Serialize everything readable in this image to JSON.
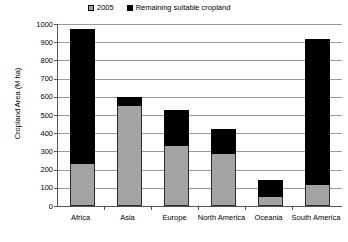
{
  "chart_data": {
    "type": "bar",
    "stacked": true,
    "title": "",
    "xlabel": "",
    "ylabel": "Cropland Area (M ha)",
    "ylim": [
      0,
      1000
    ],
    "ytick_step": 100,
    "yticks": [
      0,
      100,
      200,
      300,
      400,
      500,
      600,
      700,
      800,
      900,
      1000
    ],
    "grid": true,
    "legend_position": "top-center",
    "categories": [
      "Africa",
      "Asia",
      "Europe",
      "North America",
      "Oceania",
      "South America"
    ],
    "series": [
      {
        "name": "2005",
        "color": "#a3a3a3",
        "values": [
          230,
          550,
          330,
          285,
          50,
          115
        ]
      },
      {
        "name": "Remaining suitable cropland",
        "color": "#000000",
        "values": [
          745,
          50,
          195,
          140,
          95,
          805
        ]
      }
    ],
    "totals": [
      975,
      600,
      525,
      425,
      145,
      920
    ]
  },
  "legend": {
    "entries": [
      {
        "label": "2005",
        "swatch": "gray-square-swatch"
      },
      {
        "label": "Remaining suitable cropland",
        "swatch": "black-square-swatch"
      }
    ]
  },
  "axes": {
    "y_title": "Cropland Area (M ha)",
    "y_tick_labels": [
      "1000",
      "900",
      "800",
      "700",
      "600",
      "500",
      "400",
      "300",
      "200",
      "100",
      "0"
    ],
    "x_tick_labels": [
      "Africa",
      "Asia",
      "Europe",
      "North America",
      "Oceania",
      "South America"
    ]
  },
  "colors": {
    "series_2005": "#a3a3a3",
    "series_remaining": "#000000",
    "gridline": "#9a9a9a",
    "axis": "#555555",
    "background": "#ffffff"
  }
}
